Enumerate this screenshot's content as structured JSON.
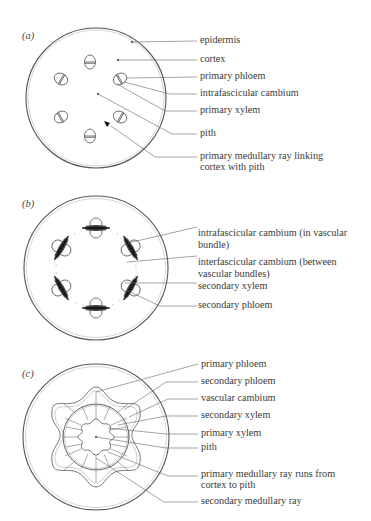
{
  "diagram": {
    "colors": {
      "line": "#555555",
      "text": "#3a3a3a",
      "background": "#ffffff",
      "tissue_dark": "#1a1a1a"
    },
    "panels": [
      {
        "tag": "(a)",
        "labels": [
          {
            "text": "epidermis"
          },
          {
            "text": "cortex"
          },
          {
            "text": "primary phloem"
          },
          {
            "text": "intrafascicular cambium"
          },
          {
            "text": "primary xylem"
          },
          {
            "text": "pith"
          },
          {
            "text": "primary medullary ray linking",
            "text2": "cortex with pith"
          }
        ]
      },
      {
        "tag": "(b)",
        "labels": [
          {
            "text": "intrafascicular cambium (in vascular",
            "text2": "bundle)"
          },
          {
            "text": "interfascicular cambium (between",
            "text2": "vascular bundles)"
          },
          {
            "text": "secondary xylem"
          },
          {
            "text": "secondary phloem"
          }
        ]
      },
      {
        "tag": "(c)",
        "labels": [
          {
            "text": "primary phloem"
          },
          {
            "text": "secondary phloem"
          },
          {
            "text": "vascular cambium"
          },
          {
            "text": "secondary xylem"
          },
          {
            "text": "primary xylem"
          },
          {
            "text": "pith"
          },
          {
            "text": "primary medullary ray runs from",
            "text2": "cortex to pith"
          },
          {
            "text": "secondary medullary ray"
          }
        ]
      }
    ]
  }
}
